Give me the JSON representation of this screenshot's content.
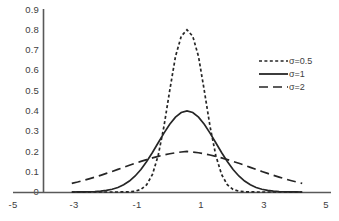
{
  "chart_data": {
    "type": "line",
    "title": "",
    "subtitle": "",
    "xlabel": "",
    "ylabel": "",
    "xlim": [
      -5,
      5
    ],
    "ylim": [
      0,
      0.9
    ],
    "grid": false,
    "legend_position": "right",
    "x_ticks": [
      "-5",
      "-3",
      "-1",
      "1",
      "3",
      "5"
    ],
    "x_tick_values": [
      -5,
      -3,
      -1,
      1,
      3,
      5
    ],
    "y_ticks": [
      "0",
      "0.1",
      "0.2",
      "0.3",
      "0.4",
      "0.5",
      "0.6",
      "0.7",
      "0.8",
      "0.9"
    ],
    "y_tick_values": [
      0,
      0.1,
      0.2,
      0.3,
      0.4,
      0.5,
      0.6,
      0.7,
      0.8,
      0.9
    ],
    "x": [
      -4,
      -3.8,
      -3.6,
      -3.4,
      -3.2,
      -3,
      -2.8,
      -2.6,
      -2.4,
      -2.2,
      -2,
      -1.8,
      -1.6,
      -1.4,
      -1.2,
      -1,
      -0.8,
      -0.6,
      -0.4,
      -0.2,
      0,
      0.2,
      0.4,
      0.6,
      0.8,
      1,
      1.2,
      1.4,
      1.6,
      1.8,
      2,
      2.2,
      2.4,
      2.6,
      2.8,
      3,
      3.2,
      3.4,
      3.6,
      3.8,
      4
    ],
    "series": [
      {
        "name": "σ=0.5",
        "label": "σ=0.5",
        "sigma": 0.5,
        "mean": 0,
        "peak": 0.798,
        "style": "dotted",
        "color": "#262626",
        "values": [
          0,
          0,
          0,
          0,
          0,
          0,
          0,
          0,
          0.0001,
          0.0003,
          0.0011,
          0.0039,
          0.0126,
          0.0355,
          0.0863,
          0.1798,
          0.3226,
          0.4991,
          0.6664,
          0.7659,
          0.7979,
          0.7659,
          0.6664,
          0.4991,
          0.3226,
          0.1798,
          0.0863,
          0.0355,
          0.0126,
          0.0039,
          0.0011,
          0.0003,
          0.0001,
          0,
          0,
          0,
          0,
          0,
          0,
          0,
          0
        ]
      },
      {
        "name": "σ=1",
        "label": "σ=1",
        "sigma": 1,
        "mean": 0,
        "peak": 0.399,
        "style": "solid",
        "color": "#262626",
        "values": [
          0.0001,
          0.0003,
          0.0006,
          0.0012,
          0.0024,
          0.0044,
          0.0079,
          0.0136,
          0.0224,
          0.0355,
          0.054,
          0.079,
          0.1109,
          0.1497,
          0.1942,
          0.242,
          0.2897,
          0.3332,
          0.3683,
          0.391,
          0.3989,
          0.391,
          0.3683,
          0.3332,
          0.2897,
          0.242,
          0.1942,
          0.1497,
          0.1109,
          0.079,
          0.054,
          0.0355,
          0.0224,
          0.0136,
          0.0079,
          0.0044,
          0.0024,
          0.0012,
          0.0006,
          0.0003,
          0.0001
        ]
      },
      {
        "name": "σ=2",
        "label": "σ=2",
        "sigma": 2,
        "mean": 0,
        "peak": 0.199,
        "style": "dashed",
        "color": "#262626",
        "values": [
          0.027,
          0.0312,
          0.0359,
          0.0409,
          0.0463,
          0.0519,
          0.0579,
          0.064,
          0.0703,
          0.0767,
          0.0833,
          0.0893,
          0.0952,
          0.1009,
          0.1061,
          0.1109,
          0.1153,
          0.119,
          0.1221,
          0.1245,
          0.1262,
          0.1245,
          0.1221,
          0.119,
          0.1153,
          0.1109,
          0.1061,
          0.1009,
          0.0952,
          0.0893,
          0.0833,
          0.0767,
          0.0703,
          0.064,
          0.0579,
          0.0519,
          0.0463,
          0.0409,
          0.0359,
          0.0312,
          0.027
        ]
      }
    ],
    "axis_color": "#595959",
    "plot": {
      "left_px": 43,
      "right_px": 331,
      "top_px": 9,
      "bottom_px": 192,
      "x_min_px": -5,
      "x_max_px": 5,
      "sigma2_display_scale": 1.58
    }
  },
  "legend": {
    "entries": [
      {
        "label": "σ=0.5",
        "style": "dotted"
      },
      {
        "label": "σ=1",
        "style": "solid"
      },
      {
        "label": "σ=2",
        "style": "dashed"
      }
    ]
  }
}
